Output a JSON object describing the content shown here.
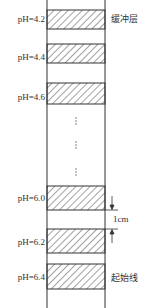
{
  "diagram": {
    "type": "pH gradient column (isoelectric focusing / zone layering schematic)",
    "column": {
      "left_x": 47,
      "right_x": 105,
      "top_y": 0,
      "bottom_y": 308,
      "line_color": "#333333"
    },
    "bands": [
      {
        "label": "pH=4.2",
        "top": 10,
        "bottom": 29,
        "label_y": 14
      },
      {
        "label": "pH=4.4",
        "top": 44,
        "bottom": 63,
        "label_y": 52
      },
      {
        "label": "pH=4.6",
        "top": 83,
        "bottom": 104,
        "label_y": 92
      },
      {
        "label": "pH=6.0",
        "top": 186,
        "bottom": 210,
        "label_y": 193
      },
      {
        "label": "pH=6.2",
        "top": 229,
        "bottom": 253,
        "label_y": 237
      },
      {
        "label": "pH=6.4",
        "top": 264,
        "bottom": 289,
        "label_y": 272
      }
    ],
    "ellipsis": "⋮",
    "annotations": {
      "buffer_layer": "缓冲层",
      "start_line": "起始线",
      "spacing": "1cm"
    },
    "hatch_color": "#444444"
  }
}
